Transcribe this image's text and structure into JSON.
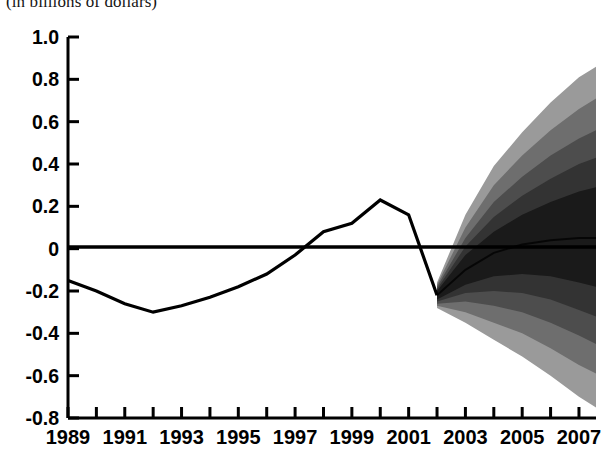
{
  "title": "(in billions of dollars)",
  "chart_data": {
    "type": "area",
    "title": "(in billions of dollars)",
    "subtitle": "",
    "xlabel": "",
    "ylabel": "",
    "xlim": [
      1989,
      2007.6
    ],
    "ylim": [
      -0.8,
      1.0
    ],
    "grid": false,
    "legend": "none",
    "y_ticks": [
      "1.0",
      "0.8",
      "0.6",
      "0.4",
      "0.2",
      "0",
      "-0.2",
      "-0.4",
      "-0.6",
      "-0.8"
    ],
    "y_tick_values": [
      1.0,
      0.8,
      0.6,
      0.4,
      0.2,
      0,
      -0.2,
      -0.4,
      -0.6,
      -0.8
    ],
    "x_ticks": [
      "1989",
      "1991",
      "1993",
      "1995",
      "1997",
      "1999",
      "2001",
      "2003",
      "2005",
      "2007"
    ],
    "x_tick_values": [
      1989,
      1991,
      1993,
      1995,
      1997,
      1999,
      2001,
      2003,
      2005,
      2007
    ],
    "x_minor_tick_values": [
      1990,
      1992,
      1994,
      1996,
      1998,
      2000,
      2002,
      2004,
      2006
    ],
    "zero_line": 0,
    "series": [
      {
        "name": "Historical",
        "type": "line",
        "color": "#000000",
        "x": [
          1989,
          1990,
          1991,
          1992,
          1993,
          1994,
          1995,
          1996,
          1997,
          1998,
          1999,
          2000,
          2001,
          2002
        ],
        "values": [
          -0.15,
          -0.2,
          -0.26,
          -0.3,
          -0.27,
          -0.23,
          -0.18,
          -0.12,
          -0.03,
          0.08,
          0.12,
          0.23,
          0.16,
          -0.22
        ]
      },
      {
        "name": "Projection fan (probability bands)",
        "type": "fan",
        "x": [
          2002,
          2003,
          2004,
          2005,
          2006,
          2007,
          2007.6
        ],
        "center": [
          -0.22,
          -0.1,
          -0.02,
          0.02,
          0.04,
          0.05,
          0.05
        ],
        "bands": [
          {
            "name": "innermost",
            "pct": 10,
            "shade": "#1a1a1a",
            "upper": [
              -0.2,
              -0.03,
              0.08,
              0.16,
              0.22,
              0.27,
              0.29
            ],
            "lower": [
              -0.24,
              -0.17,
              -0.13,
              -0.12,
              -0.13,
              -0.16,
              -0.18
            ]
          },
          {
            "name": "band-2",
            "pct": 30,
            "shade": "#333333",
            "upper": [
              -0.19,
              0.01,
              0.15,
              0.25,
              0.33,
              0.4,
              0.43
            ],
            "lower": [
              -0.25,
              -0.21,
              -0.2,
              -0.21,
              -0.24,
              -0.29,
              -0.32
            ]
          },
          {
            "name": "band-3",
            "pct": 50,
            "shade": "#4d4d4d",
            "upper": [
              -0.18,
              0.05,
              0.22,
              0.34,
              0.44,
              0.52,
              0.56
            ],
            "lower": [
              -0.26,
              -0.25,
              -0.27,
              -0.3,
              -0.35,
              -0.41,
              -0.45
            ]
          },
          {
            "name": "band-4",
            "pct": 70,
            "shade": "#6e6e6e",
            "upper": [
              -0.17,
              0.1,
              0.3,
              0.44,
              0.56,
              0.66,
              0.71
            ],
            "lower": [
              -0.27,
              -0.3,
              -0.35,
              -0.4,
              -0.47,
              -0.55,
              -0.59
            ]
          },
          {
            "name": "outermost",
            "pct": 90,
            "shade": "#9a9a9a",
            "upper": [
              -0.16,
              0.16,
              0.39,
              0.55,
              0.69,
              0.81,
              0.86
            ],
            "lower": [
              -0.28,
              -0.35,
              -0.43,
              -0.51,
              -0.6,
              -0.7,
              -0.75
            ]
          }
        ]
      }
    ]
  }
}
